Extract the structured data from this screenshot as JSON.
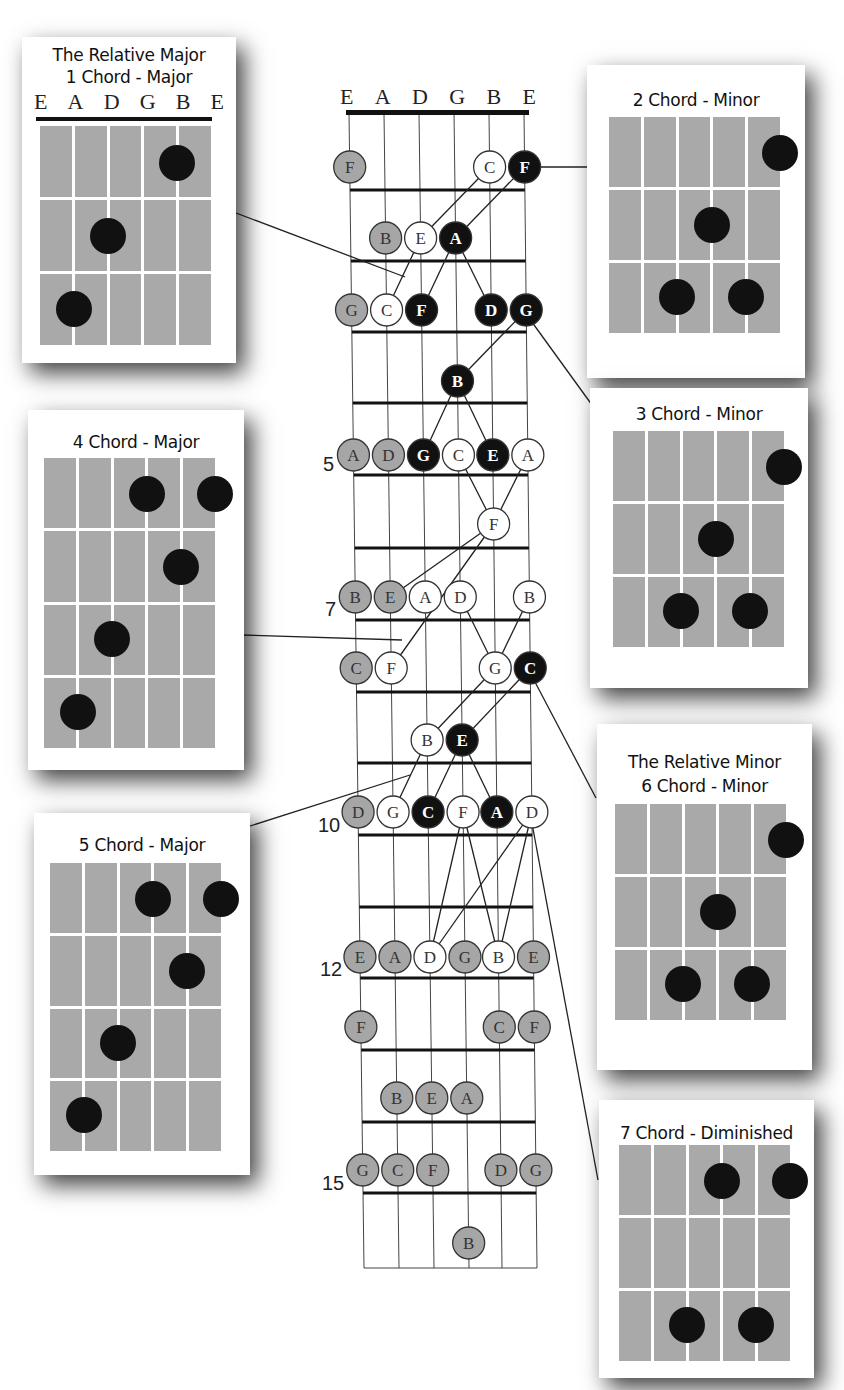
{
  "fretboard": {
    "string_labels": [
      "E",
      "A",
      "D",
      "G",
      "B",
      "E"
    ],
    "fret_markers": [
      {
        "label": "5",
        "y": 466
      },
      {
        "label": "7",
        "y": 610
      },
      {
        "label": "10",
        "y": 826
      },
      {
        "label": "12",
        "y": 970
      },
      {
        "label": "15",
        "y": 1185
      }
    ],
    "legend": {
      "gray": "scale note",
      "white": "chord tone (minor/diminished)",
      "black": "chord tone (major)"
    },
    "colors": {
      "gray": "#a6a6a6",
      "white": "#ffffff",
      "black": "#111111"
    },
    "notes": [
      {
        "row": 0,
        "y": 167,
        "items": [
          {
            "s": 0,
            "n": "F",
            "c": "gray"
          },
          {
            "s": 4,
            "n": "C",
            "c": "white"
          },
          {
            "s": 5,
            "n": "F",
            "c": "black"
          }
        ]
      },
      {
        "row": 1,
        "y": 238,
        "items": [
          {
            "s": 1,
            "n": "B",
            "c": "gray"
          },
          {
            "s": 2,
            "n": "E",
            "c": "white"
          },
          {
            "s": 3,
            "n": "A",
            "c": "black"
          }
        ]
      },
      {
        "row": 2,
        "y": 310,
        "items": [
          {
            "s": 0,
            "n": "G",
            "c": "gray"
          },
          {
            "s": 1,
            "n": "C",
            "c": "white"
          },
          {
            "s": 2,
            "n": "F",
            "c": "black"
          },
          {
            "s": 4,
            "n": "D",
            "c": "black"
          },
          {
            "s": 5,
            "n": "G",
            "c": "black"
          }
        ]
      },
      {
        "row": 3,
        "y": 381,
        "items": [
          {
            "s": 3,
            "n": "B",
            "c": "black"
          }
        ]
      },
      {
        "row": 4,
        "y": 455,
        "items": [
          {
            "s": 0,
            "n": "A",
            "c": "gray"
          },
          {
            "s": 1,
            "n": "D",
            "c": "gray"
          },
          {
            "s": 2,
            "n": "G",
            "c": "black"
          },
          {
            "s": 3,
            "n": "C",
            "c": "white"
          },
          {
            "s": 4,
            "n": "E",
            "c": "black"
          },
          {
            "s": 5,
            "n": "A",
            "c": "white"
          }
        ]
      },
      {
        "row": 5,
        "y": 524,
        "items": [
          {
            "s": 4,
            "n": "F",
            "c": "white"
          }
        ]
      },
      {
        "row": 6,
        "y": 597,
        "items": [
          {
            "s": 0,
            "n": "B",
            "c": "gray"
          },
          {
            "s": 1,
            "n": "E",
            "c": "gray"
          },
          {
            "s": 2,
            "n": "A",
            "c": "white"
          },
          {
            "s": 3,
            "n": "D",
            "c": "white"
          },
          {
            "s": 5,
            "n": "B",
            "c": "white"
          }
        ]
      },
      {
        "row": 7,
        "y": 668,
        "items": [
          {
            "s": 0,
            "n": "C",
            "c": "gray"
          },
          {
            "s": 1,
            "n": "F",
            "c": "white"
          },
          {
            "s": 4,
            "n": "G",
            "c": "white"
          },
          {
            "s": 5,
            "n": "C",
            "c": "black"
          }
        ]
      },
      {
        "row": 8,
        "y": 740,
        "items": [
          {
            "s": 2,
            "n": "B",
            "c": "white"
          },
          {
            "s": 3,
            "n": "E",
            "c": "black"
          }
        ]
      },
      {
        "row": 9,
        "y": 812,
        "items": [
          {
            "s": 0,
            "n": "D",
            "c": "gray"
          },
          {
            "s": 1,
            "n": "G",
            "c": "white"
          },
          {
            "s": 2,
            "n": "C",
            "c": "black"
          },
          {
            "s": 3,
            "n": "F",
            "c": "white"
          },
          {
            "s": 4,
            "n": "A",
            "c": "black"
          },
          {
            "s": 5,
            "n": "D",
            "c": "white"
          }
        ]
      },
      {
        "row": 10,
        "y": 957,
        "items": [
          {
            "s": 0,
            "n": "E",
            "c": "gray"
          },
          {
            "s": 1,
            "n": "A",
            "c": "gray"
          },
          {
            "s": 2,
            "n": "D",
            "c": "white"
          },
          {
            "s": 3,
            "n": "G",
            "c": "gray"
          },
          {
            "s": 4,
            "n": "B",
            "c": "white"
          },
          {
            "s": 5,
            "n": "E",
            "c": "gray"
          }
        ]
      },
      {
        "row": 11,
        "y": 1027,
        "items": [
          {
            "s": 0,
            "n": "F",
            "c": "gray"
          },
          {
            "s": 4,
            "n": "C",
            "c": "gray"
          },
          {
            "s": 5,
            "n": "F",
            "c": "gray"
          }
        ]
      },
      {
        "row": 12,
        "y": 1098,
        "items": [
          {
            "s": 1,
            "n": "B",
            "c": "gray"
          },
          {
            "s": 2,
            "n": "E",
            "c": "gray"
          },
          {
            "s": 3,
            "n": "A",
            "c": "gray"
          }
        ]
      },
      {
        "row": 13,
        "y": 1170,
        "items": [
          {
            "s": 0,
            "n": "G",
            "c": "gray"
          },
          {
            "s": 1,
            "n": "C",
            "c": "gray"
          },
          {
            "s": 2,
            "n": "F",
            "c": "gray"
          },
          {
            "s": 4,
            "n": "D",
            "c": "gray"
          },
          {
            "s": 5,
            "n": "G",
            "c": "gray"
          }
        ]
      },
      {
        "row": 14,
        "y": 1243,
        "items": [
          {
            "s": 3,
            "n": "B",
            "c": "gray"
          }
        ]
      }
    ]
  },
  "cards": [
    {
      "id": "chord-1",
      "title_lines": [
        "The Relative Major",
        "1 Chord - Major"
      ],
      "show_strings": true,
      "string_labels": [
        "E",
        "A",
        "D",
        "G",
        "B",
        "E"
      ],
      "frets": 3,
      "dots": [
        [
          4,
          0
        ],
        [
          2,
          1
        ],
        [
          1,
          2
        ]
      ]
    },
    {
      "id": "chord-2",
      "title_lines": [
        "2 Chord - Minor"
      ],
      "frets": 3,
      "dots": [
        [
          5,
          0
        ],
        [
          3,
          1
        ],
        [
          2,
          2
        ],
        [
          4,
          2
        ]
      ]
    },
    {
      "id": "chord-3",
      "title_lines": [
        "3 Chord - Minor"
      ],
      "frets": 3,
      "dots": [
        [
          5,
          0
        ],
        [
          3,
          1
        ],
        [
          2,
          2
        ],
        [
          4,
          2
        ]
      ]
    },
    {
      "id": "chord-4",
      "title_lines": [
        "4 Chord - Major"
      ],
      "frets": 4,
      "dots": [
        [
          3,
          0
        ],
        [
          5,
          0
        ],
        [
          4,
          1
        ],
        [
          2,
          2
        ],
        [
          1,
          3
        ]
      ]
    },
    {
      "id": "chord-5",
      "title_lines": [
        "5 Chord - Major"
      ],
      "frets": 4,
      "dots": [
        [
          3,
          0
        ],
        [
          5,
          0
        ],
        [
          4,
          1
        ],
        [
          2,
          2
        ],
        [
          1,
          3
        ]
      ]
    },
    {
      "id": "chord-6",
      "title_lines": [
        "The Relative Minor",
        "6 Chord - Minor"
      ],
      "frets": 3,
      "dots": [
        [
          5,
          0
        ],
        [
          3,
          1
        ],
        [
          2,
          2
        ],
        [
          4,
          2
        ]
      ]
    },
    {
      "id": "chord-7",
      "title_lines": [
        "7 Chord - Diminished"
      ],
      "frets": 3,
      "dots": [
        [
          3,
          0
        ],
        [
          5,
          0
        ],
        [
          2,
          2
        ],
        [
          4,
          2
        ]
      ]
    }
  ]
}
